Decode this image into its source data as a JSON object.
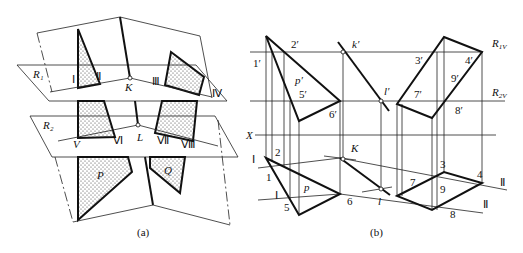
{
  "figure_a": {
    "caption": "(a)",
    "labels": {
      "R1": "R₁",
      "R2": "R₂",
      "K": "K",
      "L": "L",
      "P": "P",
      "Q": "Q",
      "I": "Ⅰ",
      "II": "Ⅱ",
      "III": "Ⅲ",
      "IV": "Ⅳ",
      "V": "V",
      "VI": "Ⅵ",
      "VII": "Ⅶ",
      "VIII": "Ⅷ"
    }
  },
  "figure_b": {
    "caption": "(b)",
    "labels": {
      "1p": "1′",
      "2p": "2′",
      "3p": "3′",
      "4p": "4′",
      "5p": "5′",
      "6p": "6′",
      "7p": "7′",
      "8p": "8′",
      "9p": "9′",
      "pp": "p′",
      "kp": "k′",
      "lp": "l′",
      "R1V": "R",
      "R1V_sub": "1V",
      "R2V": "R",
      "R2V_sub": "2V",
      "X": "X",
      "n1": "1",
      "n2": "2",
      "n3": "3",
      "n4": "4",
      "n5": "5",
      "n6": "6",
      "n7": "7",
      "n8": "8",
      "n9": "9",
      "p": "p",
      "K": "K",
      "l": "l",
      "I_a": "Ⅰ",
      "I_b": "Ⅰ",
      "II_a": "Ⅱ",
      "II_b": "Ⅱ"
    }
  }
}
